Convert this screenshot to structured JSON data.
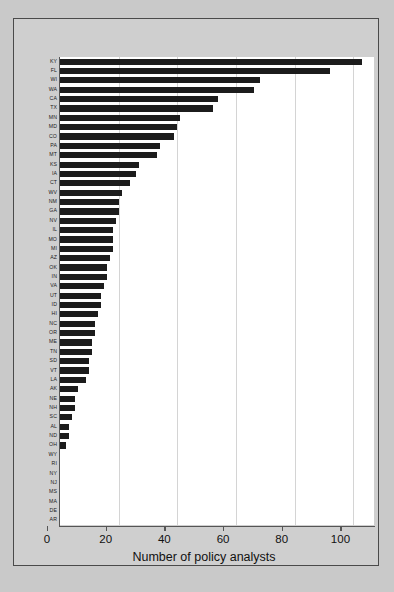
{
  "chart_data": {
    "type": "bar",
    "orientation": "horizontal",
    "title": "",
    "subtitle": "",
    "xlabel": "Number of policy analysts",
    "ylabel": "",
    "xlim": [
      0,
      107
    ],
    "xticks": [
      0,
      20,
      40,
      60,
      80,
      100
    ],
    "xtick_labels": [
      "0",
      "20",
      "40",
      "60",
      "80",
      "100"
    ],
    "grid": "vertical",
    "legend": "none",
    "bar_color": "#1c1c1c",
    "plot_background": "#ffffff",
    "figure_background": "#cfcfcf",
    "categories": [
      "KY",
      "FL",
      "WI",
      "WA",
      "CA",
      "TX",
      "MN",
      "MD",
      "CO",
      "PA",
      "MT",
      "KS",
      "IA",
      "CT",
      "WV",
      "NM",
      "GA",
      "NV",
      "IL",
      "MO",
      "MI",
      "AZ",
      "OK",
      "IN",
      "VA",
      "UT",
      "ID",
      "HI",
      "NC",
      "OR",
      "ME",
      "TN",
      "SD",
      "VT",
      "LA",
      "AK",
      "NE",
      "NH",
      "SC",
      "AL",
      "ND",
      "OH",
      "WY",
      "RI",
      "NY",
      "NJ",
      "MS",
      "MA",
      "DE",
      "AR"
    ],
    "values": [
      103,
      92,
      68,
      66,
      54,
      52,
      41,
      40,
      39,
      34,
      33,
      27,
      26,
      24,
      21,
      20,
      20,
      19,
      18,
      18,
      18,
      17,
      16,
      16,
      15,
      14,
      14,
      13,
      12,
      12,
      11,
      11,
      10,
      10,
      9,
      6,
      5,
      5,
      4,
      3,
      3,
      2,
      0,
      0,
      0,
      0,
      0,
      0,
      0,
      0
    ]
  }
}
